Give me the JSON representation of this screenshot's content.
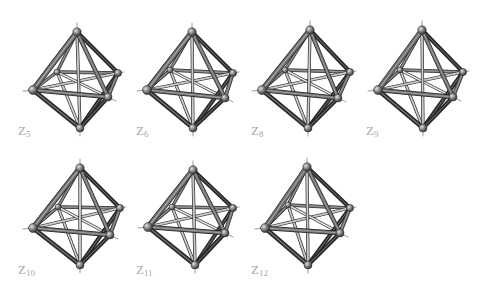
{
  "figure": {
    "colors": {
      "background": "#ffffff",
      "rod_dark": "#2e2e2e",
      "rod_mid": "#6e6e6e",
      "rod_light": "#b9b9b9",
      "rod_highlight": "#d9d9d9",
      "atom_fill": "#7a7a7a",
      "atom_highlight": "#d8d8d8",
      "label": "#a8a8a8"
    },
    "panels": [
      {
        "id": "z5",
        "label_main": "Z",
        "label_sub": "5",
        "label_pos": [
          18,
          124
        ],
        "vertices": {
          "top": [
            77,
            32
          ],
          "left": [
            33,
            90
          ],
          "right": [
            118,
            73
          ],
          "front": [
            108,
            97
          ],
          "back": [
            57,
            72
          ],
          "bottom": [
            80,
            128
          ]
        }
      },
      {
        "id": "z6",
        "label_main": "Z",
        "label_sub": "6",
        "label_pos": [
          136,
          124
        ],
        "vertices": {
          "top": [
            192,
            32
          ],
          "left": [
            147,
            90
          ],
          "right": [
            233,
            73
          ],
          "front": [
            225,
            98
          ],
          "back": [
            170,
            70
          ],
          "bottom": [
            193,
            128
          ]
        }
      },
      {
        "id": "z8",
        "label_main": "Z",
        "label_sub": "8",
        "label_pos": [
          251,
          124
        ],
        "vertices": {
          "top": [
            310,
            30
          ],
          "left": [
            262,
            90
          ],
          "right": [
            350,
            72
          ],
          "front": [
            338,
            98
          ],
          "back": [
            285,
            70
          ],
          "bottom": [
            308,
            128
          ]
        }
      },
      {
        "id": "z9",
        "label_main": "Z",
        "label_sub": "9",
        "label_pos": [
          366,
          124
        ],
        "vertices": {
          "top": [
            422,
            30
          ],
          "left": [
            378,
            90
          ],
          "right": [
            463,
            72
          ],
          "front": [
            453,
            97
          ],
          "back": [
            400,
            70
          ],
          "bottom": [
            423,
            128
          ]
        }
      },
      {
        "id": "z10",
        "label_main": "Z",
        "label_sub": "10",
        "label_pos": [
          18,
          263
        ],
        "vertices": {
          "top": [
            80,
            168
          ],
          "left": [
            33,
            228
          ],
          "right": [
            120,
            208
          ],
          "front": [
            110,
            235
          ],
          "back": [
            58,
            207
          ],
          "bottom": [
            80,
            265
          ]
        }
      },
      {
        "id": "z11",
        "label_main": "Z",
        "label_sub": "11",
        "label_pos": [
          136,
          263
        ],
        "vertices": {
          "top": [
            193,
            170
          ],
          "left": [
            148,
            227
          ],
          "right": [
            233,
            208
          ],
          "front": [
            225,
            233
          ],
          "back": [
            172,
            207
          ],
          "bottom": [
            195,
            265
          ]
        }
      },
      {
        "id": "z12",
        "label_main": "Z",
        "label_sub": "12",
        "label_pos": [
          251,
          263
        ],
        "vertices": {
          "top": [
            307,
            167
          ],
          "left": [
            265,
            228
          ],
          "right": [
            350,
            208
          ],
          "front": [
            340,
            233
          ],
          "back": [
            288,
            205
          ],
          "bottom": [
            308,
            265
          ]
        }
      }
    ]
  }
}
